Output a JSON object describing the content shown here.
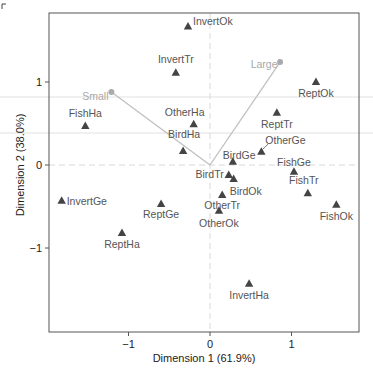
{
  "chart_data": {
    "type": "scatter",
    "title": "",
    "xlabel": "Dimension 1 (61.9%)",
    "ylabel": "Dimension 2 (38.0%)",
    "xlim": [
      -1.95,
      1.85
    ],
    "ylim": [
      -1.99,
      1.84
    ],
    "xticks": [
      -1,
      0,
      1
    ],
    "yticks": [
      -1,
      0,
      1
    ],
    "reference_lines": {
      "x": 0,
      "y": 0,
      "style": "dashed"
    },
    "grid": false,
    "series": [
      {
        "name": "row categories",
        "marker": "triangle",
        "color": "#444444",
        "points": [
          {
            "label": "InvertOk",
            "x": -0.27,
            "y": 1.67
          },
          {
            "label": "InvertTr",
            "x": -0.42,
            "y": 1.11
          },
          {
            "label": "ReptOk",
            "x": 1.3,
            "y": 1.0
          },
          {
            "label": "FishHa",
            "x": -1.53,
            "y": 0.47
          },
          {
            "label": "OtherHa",
            "x": -0.2,
            "y": 0.49
          },
          {
            "label": "ReptTr",
            "x": 0.82,
            "y": 0.63
          },
          {
            "label": "BirdHa",
            "x": -0.33,
            "y": 0.17
          },
          {
            "label": "OtherGe",
            "x": 0.63,
            "y": 0.16
          },
          {
            "label": "BirdGe",
            "x": 0.28,
            "y": 0.04
          },
          {
            "label": "FishGe",
            "x": 1.03,
            "y": -0.08
          },
          {
            "label": "BirdTr",
            "x": 0.23,
            "y": -0.12
          },
          {
            "label": "BirdOk",
            "x": 0.29,
            "y": -0.17
          },
          {
            "label": "FishTr",
            "x": 1.2,
            "y": -0.34
          },
          {
            "label": "FishOk",
            "x": 1.55,
            "y": -0.48
          },
          {
            "label": "InvertGe",
            "x": -1.82,
            "y": -0.43
          },
          {
            "label": "ReptGe",
            "x": -0.6,
            "y": -0.47
          },
          {
            "label": "OtherTr",
            "x": 0.15,
            "y": -0.36
          },
          {
            "label": "OtherOk",
            "x": 0.11,
            "y": -0.55
          },
          {
            "label": "ReptHa",
            "x": -1.08,
            "y": -0.82
          },
          {
            "label": "InvertHa",
            "x": 0.48,
            "y": -1.43
          }
        ]
      },
      {
        "name": "column categories (vectors from origin)",
        "marker": "circle",
        "color": "#aaaaaa",
        "points": [
          {
            "label": "Small",
            "x": -1.21,
            "y": 0.88
          },
          {
            "label": "Large",
            "x": 0.86,
            "y": 1.24
          }
        ]
      }
    ]
  }
}
